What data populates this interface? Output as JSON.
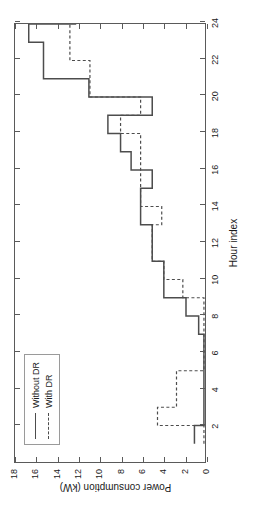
{
  "chart_data": {
    "type": "line",
    "title": "",
    "xlabel": "Hour index",
    "ylabel": "Power consumption (kW)",
    "xlim": [
      0,
      24
    ],
    "ylim": [
      0,
      18
    ],
    "xticks": [
      2,
      4,
      6,
      8,
      10,
      12,
      14,
      16,
      18,
      20,
      22,
      24
    ],
    "yticks": [
      0,
      2,
      4,
      6,
      8,
      10,
      12,
      14,
      16,
      18
    ],
    "grid": false,
    "drawstyle": "steps-post",
    "legend_position": "upper left",
    "x": [
      1,
      2,
      3,
      4,
      5,
      6,
      7,
      8,
      9,
      10,
      11,
      12,
      13,
      14,
      15,
      16,
      17,
      18,
      19,
      20,
      21,
      22,
      23,
      24
    ],
    "series": [
      {
        "name": "Without DR",
        "style": "solid",
        "color": "#4d4d4d",
        "values": [
          1.0,
          0.1,
          0.1,
          0.1,
          0.1,
          0.1,
          0.6,
          1.8,
          3.9,
          3.9,
          5.0,
          5.0,
          6.1,
          6.1,
          5.0,
          7.0,
          8.0,
          9.2,
          5.0,
          11.0,
          15.3,
          15.3,
          16.7,
          12.2
        ]
      },
      {
        "name": "With DR",
        "style": "dashed",
        "color": "#4d4d4d",
        "values": [
          0.1,
          4.5,
          2.7,
          2.7,
          0.1,
          0.1,
          0.1,
          0.1,
          2.1,
          3.9,
          5.0,
          5.0,
          4.1,
          6.1,
          6.1,
          6.1,
          6.1,
          8.0,
          6.1,
          10.9,
          10.9,
          12.8,
          12.8,
          12.8
        ]
      }
    ]
  },
  "axis": {
    "x_title": "Hour index",
    "y_title": "Power consumption (kW)",
    "x_tick_labels": [
      "2",
      "4",
      "6",
      "8",
      "10",
      "12",
      "14",
      "16",
      "18",
      "20",
      "22",
      "24"
    ],
    "y_tick_labels": [
      "0",
      "2",
      "4",
      "6",
      "8",
      "10",
      "12",
      "14",
      "16",
      "18"
    ]
  },
  "legend": {
    "items": [
      {
        "label": "Without DR",
        "style": "solid"
      },
      {
        "label": "With DR",
        "style": "dashed"
      }
    ]
  },
  "colors": {
    "line": "#4d4d4d",
    "frame": "#5a5a5a",
    "text": "#1a1a1a",
    "background": "#ffffff"
  }
}
